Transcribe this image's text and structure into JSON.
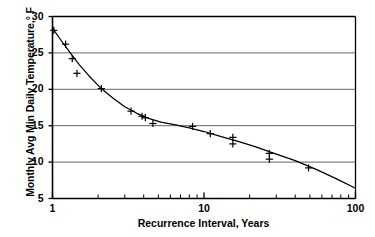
{
  "chart_data": {
    "type": "line",
    "title": "",
    "xlabel": "Recurrence Interval, Years",
    "ylabel": "Monthly Avg Min Daily Temperature,° F",
    "xscale": "log",
    "yscale": "linear",
    "xlim": [
      1,
      100
    ],
    "ylim": [
      5,
      30
    ],
    "grid": "horizontal",
    "legend": null,
    "xticks": [
      {
        "value": 1,
        "label": "1"
      },
      {
        "value": 10,
        "label": "10"
      },
      {
        "value": 100,
        "label": "100"
      }
    ],
    "xminor_ticks": [
      2,
      3,
      4,
      5,
      6,
      7,
      8,
      9,
      20,
      30,
      40,
      50,
      60,
      70,
      80,
      90
    ],
    "yticks": [
      {
        "value": 5,
        "label": "5"
      },
      {
        "value": 10,
        "label": "10"
      },
      {
        "value": 15,
        "label": "15"
      },
      {
        "value": 20,
        "label": "20"
      },
      {
        "value": 25,
        "label": "25"
      },
      {
        "value": 30,
        "label": "30"
      }
    ],
    "gridlines_y": [
      10,
      15,
      20,
      25,
      30
    ],
    "series": [
      {
        "name": "observations",
        "marker": "plus",
        "type": "scatter",
        "points": [
          {
            "x": 1.02,
            "y": 28.1
          },
          {
            "x": 1.22,
            "y": 26.2
          },
          {
            "x": 1.35,
            "y": 24.2
          },
          {
            "x": 1.45,
            "y": 22.2
          },
          {
            "x": 2.1,
            "y": 20.1
          },
          {
            "x": 3.3,
            "y": 17.0
          },
          {
            "x": 3.9,
            "y": 16.3
          },
          {
            "x": 4.1,
            "y": 16.1
          },
          {
            "x": 4.6,
            "y": 15.3
          },
          {
            "x": 8.4,
            "y": 14.9
          },
          {
            "x": 11.0,
            "y": 13.9
          },
          {
            "x": 15.5,
            "y": 13.4
          },
          {
            "x": 15.5,
            "y": 12.5
          },
          {
            "x": 27.0,
            "y": 11.2
          },
          {
            "x": 27.0,
            "y": 10.4
          },
          {
            "x": 49.0,
            "y": 9.2
          }
        ]
      },
      {
        "name": "fitted-curve",
        "type": "line",
        "points": [
          {
            "x": 1.0,
            "y": 28.4
          },
          {
            "x": 1.15,
            "y": 26.6
          },
          {
            "x": 1.3,
            "y": 25.1
          },
          {
            "x": 1.5,
            "y": 23.4
          },
          {
            "x": 1.75,
            "y": 21.8
          },
          {
            "x": 2.1,
            "y": 20.1
          },
          {
            "x": 2.5,
            "y": 18.8
          },
          {
            "x": 3.0,
            "y": 17.6
          },
          {
            "x": 3.6,
            "y": 16.7
          },
          {
            "x": 4.3,
            "y": 16.0
          },
          {
            "x": 5.2,
            "y": 15.5
          },
          {
            "x": 6.5,
            "y": 15.1
          },
          {
            "x": 8.0,
            "y": 14.7
          },
          {
            "x": 10.0,
            "y": 14.2
          },
          {
            "x": 13.0,
            "y": 13.5
          },
          {
            "x": 17.0,
            "y": 12.8
          },
          {
            "x": 22.0,
            "y": 12.1
          },
          {
            "x": 30.0,
            "y": 11.1
          },
          {
            "x": 40.0,
            "y": 10.2
          },
          {
            "x": 55.0,
            "y": 9.0
          },
          {
            "x": 75.0,
            "y": 7.7
          },
          {
            "x": 100.0,
            "y": 6.4
          }
        ]
      }
    ],
    "colors": {
      "axis": "#000000",
      "grid": "#555555",
      "curve": "#000000",
      "marker": "#000000",
      "background": "#ffffff"
    }
  }
}
